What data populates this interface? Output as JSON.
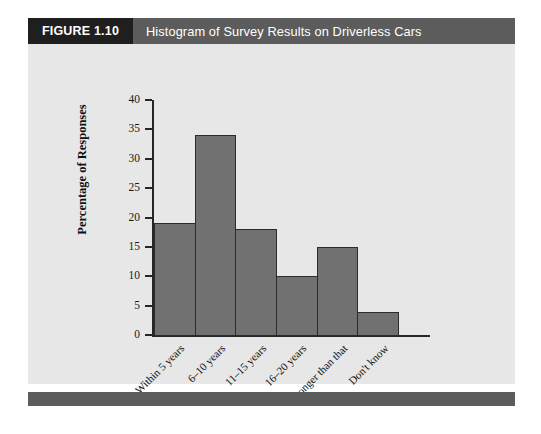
{
  "figure": {
    "number_label": "FIGURE 1.10",
    "title": "Histogram of Survey Results on Driverless Cars"
  },
  "colors": {
    "figure_number_bg": "#201f1f",
    "title_bar_bg": "#5c5c5c",
    "panel_bg": "#e7e7e7",
    "footer_bg": "#5c5c5c",
    "bar_fill": "#717171",
    "bar_stroke": "#2b2b2b",
    "axis": "#262626",
    "text": "#111111"
  },
  "chart_data": {
    "type": "bar",
    "title": "Histogram of Survey Results on Driverless Cars",
    "xlabel": "Time",
    "ylabel": "Percentage of Responses",
    "categories": [
      "Within 5 years",
      "6–10 years",
      "11–15 years",
      "16–20 years",
      "Longer than that",
      "Don't know"
    ],
    "values": [
      19,
      34,
      18,
      10,
      15,
      4
    ],
    "ylim": [
      0,
      40
    ],
    "ytick_step": 5,
    "yticks": [
      0,
      5,
      10,
      15,
      20,
      25,
      30,
      35,
      40
    ],
    "ytick_labels": [
      "0",
      "5",
      "10",
      "15",
      "20",
      "25",
      "30",
      "35",
      "40"
    ],
    "grid": false,
    "legend": false,
    "bar_gap": 0,
    "xtick_label_rotation": -45
  }
}
